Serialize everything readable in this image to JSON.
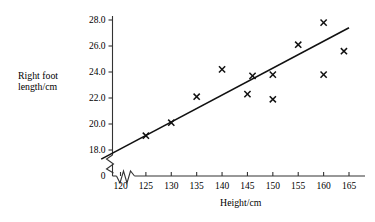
{
  "chart_data": {
    "type": "scatter",
    "title": "",
    "xlabel": "Height/cm",
    "ylabel": "Right foot length/cm",
    "ylabel_line1": "Right foot",
    "ylabel_line2": "length/cm",
    "xlim": [
      118,
      166
    ],
    "ylim": [
      17.0,
      28.4
    ],
    "xticks": [
      120,
      125,
      130,
      135,
      140,
      145,
      150,
      155,
      160,
      165
    ],
    "yticks": [
      18.0,
      20.0,
      22.0,
      24.0,
      26.0,
      28.0
    ],
    "xtick_labels": [
      "120",
      "125",
      "130",
      "135",
      "140",
      "145",
      "150",
      "155",
      "160",
      "165"
    ],
    "ytick_labels": [
      "18.0",
      "20.0",
      "22.0",
      "24.0",
      "26.0",
      "28.0"
    ],
    "origin_label": "0",
    "axis_break_x": true,
    "axis_break_y": true,
    "grid": false,
    "legend": "none",
    "marker": "x-cross",
    "marker_color": "#111111",
    "line_color": "#111111",
    "axis_color": "#333333",
    "points": [
      {
        "x": 125,
        "y": 19.1
      },
      {
        "x": 130,
        "y": 20.1
      },
      {
        "x": 135,
        "y": 22.1
      },
      {
        "x": 140,
        "y": 24.2
      },
      {
        "x": 145,
        "y": 22.3
      },
      {
        "x": 146,
        "y": 23.7
      },
      {
        "x": 150,
        "y": 23.8
      },
      {
        "x": 150,
        "y": 21.9
      },
      {
        "x": 155,
        "y": 26.1
      },
      {
        "x": 160,
        "y": 27.8
      },
      {
        "x": 160,
        "y": 23.8
      },
      {
        "x": 164,
        "y": 25.6
      }
    ],
    "fit_line": {
      "name": "line of best fit",
      "x1": 116.2,
      "y1": 17.3,
      "x2": 165.0,
      "y2": 27.4
    }
  }
}
